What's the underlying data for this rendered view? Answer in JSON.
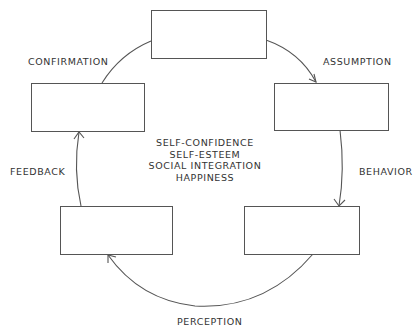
{
  "diagram": {
    "boxes": [
      {
        "id": "top",
        "label": ""
      },
      {
        "id": "right-upper",
        "label": ""
      },
      {
        "id": "right-lower",
        "label": ""
      },
      {
        "id": "left-lower",
        "label": ""
      },
      {
        "id": "left-upper",
        "label": ""
      }
    ],
    "edge_labels": {
      "assumption": "ASSUMPTION",
      "behavior": "BEHAVIOR",
      "perception": "PERCEPTION",
      "feedback": "FEEDBACK",
      "confirmation": "CONFIRMATION"
    },
    "center_items": [
      "SELF-CONFIDENCE",
      "SELF-ESTEEM",
      "SOCIAL INTEGRATION",
      "HAPPINESS"
    ],
    "colors": {
      "stroke": "#555555",
      "text": "#333333",
      "background": "#ffffff"
    }
  }
}
